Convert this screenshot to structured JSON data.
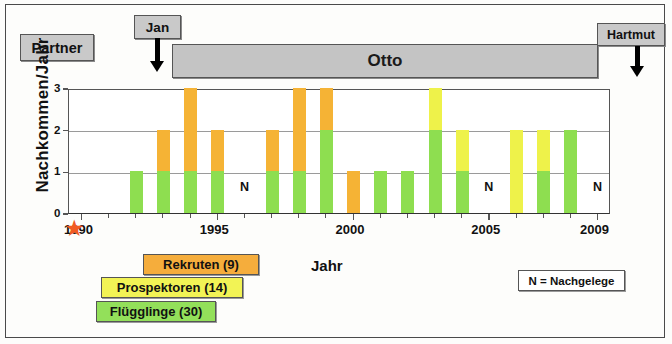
{
  "timeline": {
    "partner_label": "Partner",
    "jan_label": "Jan",
    "otto_label": "Otto",
    "hartmut_label": "Hartmut"
  },
  "legend": {
    "rekruten": "Rekruten (9)",
    "prospektoren": "Prospektoren (14)",
    "fluegglinge": "Flügglinge (30)",
    "nachgelege": "N = Nachgelege"
  },
  "colors": {
    "fluegglinge": "#8ede50",
    "prospektoren": "#eef24a",
    "rekruten": "#f5b335",
    "timeline_bar": "#c4c4c4",
    "star": "#f15a22"
  },
  "axis": {
    "y_ticks": [
      "0",
      "1",
      "2",
      "3"
    ],
    "x_major_labels": [
      "1990",
      "1995",
      "2000",
      "2005",
      "2009"
    ],
    "n_markers": [
      "N",
      "N",
      "N"
    ]
  },
  "chart_data": {
    "type": "bar",
    "title": "",
    "xlabel": "Jahr",
    "ylabel": "Nachkommen/Jahr",
    "ylim": [
      0,
      3
    ],
    "xlim": [
      1990,
      2009
    ],
    "grid": true,
    "legend_position": "bottom-left",
    "stacked": true,
    "categories": [
      1990,
      1991,
      1992,
      1993,
      1994,
      1995,
      1996,
      1997,
      1998,
      1999,
      2000,
      2001,
      2002,
      2003,
      2004,
      2005,
      2006,
      2007,
      2008,
      2009
    ],
    "series": [
      {
        "name": "Flügglinge (30)",
        "color": "#8ede50",
        "values": [
          0,
          0,
          1,
          1,
          1,
          1,
          0,
          1,
          1,
          2,
          0,
          1,
          1,
          2,
          1,
          0,
          0,
          1,
          2,
          0
        ]
      },
      {
        "name": "Prospektoren (14)",
        "color": "#eef24a",
        "values": [
          0,
          0,
          0,
          0,
          0,
          0,
          0,
          0,
          0,
          0,
          0,
          0,
          0,
          1,
          1,
          0,
          2,
          1,
          0,
          0
        ]
      },
      {
        "name": "Rekruten (9)",
        "color": "#f5b335",
        "values": [
          0,
          0,
          0,
          1,
          2,
          1,
          0,
          1,
          2,
          1,
          1,
          0,
          0,
          0,
          0,
          0,
          0,
          0,
          0,
          0
        ]
      }
    ],
    "totals": [
      0,
      0,
      1,
      2,
      3,
      2,
      0,
      2,
      3,
      3,
      1,
      1,
      1,
      3,
      2,
      0,
      2,
      2,
      2,
      0
    ],
    "annotations": [
      {
        "text": "N",
        "year": 1996
      },
      {
        "text": "N",
        "year": 2005
      },
      {
        "text": "N",
        "year": 2009
      }
    ]
  }
}
